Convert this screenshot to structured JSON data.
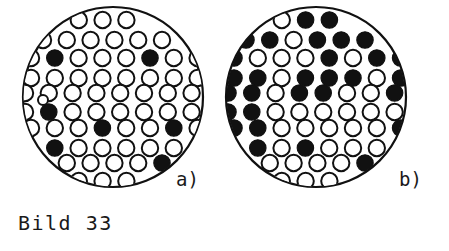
{
  "figure": {
    "caption": "Bild 33",
    "type": "technical-illustration",
    "colors": {
      "background": "#ffffff",
      "stroke": "#111111",
      "filled": "#111111",
      "open_fill": "#ffffff"
    }
  },
  "panels": [
    {
      "id": "a",
      "label": "a)",
      "label_x": 176,
      "label_y": 186,
      "boundary": {
        "cx": 113,
        "cy": 97,
        "r": 90
      },
      "cell_radius": 8.2,
      "row_pitch": 20.6,
      "col_pitch": 23.8,
      "filled_count": 7,
      "open_count": 52,
      "rows": [
        {
          "y": 20,
          "x_start": 55,
          "cells": [
            "open",
            "open",
            "open",
            "open"
          ]
        },
        {
          "y": 40,
          "x_start": 43,
          "cells": [
            "open",
            "open",
            "open",
            "open",
            "open",
            "open"
          ]
        },
        {
          "y": 58,
          "x_start": 31,
          "cells": [
            "open",
            "filled",
            "open",
            "open",
            "open",
            "filled",
            "open",
            "open"
          ]
        },
        {
          "y": 78,
          "x_start": 31,
          "cells": [
            "open",
            "open",
            "open",
            "open",
            "open",
            "open",
            "open",
            "open"
          ]
        },
        {
          "y": 93,
          "x_start": 25,
          "cells": [
            "open",
            "open",
            "open",
            "open",
            "open",
            "open",
            "open",
            "open",
            "open"
          ]
        },
        {
          "y": 112,
          "x_start": 25,
          "cells": [
            "open",
            "filled",
            "open",
            "open",
            "open",
            "open",
            "open",
            "open",
            "open"
          ]
        },
        {
          "y": 128,
          "x_start": 31,
          "cells": [
            "open",
            "open",
            "open",
            "filled",
            "open",
            "open",
            "filled",
            "open"
          ]
        },
        {
          "y": 148,
          "x_start": 31,
          "cells": [
            "open",
            "filled",
            "open",
            "open",
            "open",
            "open",
            "open",
            "open"
          ]
        },
        {
          "y": 163,
          "x_start": 43,
          "cells": [
            "open",
            "open",
            "open",
            "open",
            "open",
            "filled"
          ]
        },
        {
          "y": 181,
          "x_start": 55,
          "cells": [
            "open",
            "open",
            "open",
            "open"
          ]
        }
      ],
      "extra_cells": [
        {
          "x": 43,
          "y": 100,
          "r": 5.0,
          "state": "open"
        }
      ]
    },
    {
      "id": "b",
      "label": "b)",
      "label_x": 399,
      "label_y": 186,
      "boundary": {
        "cx": 316,
        "cy": 97,
        "r": 90
      },
      "cell_radius": 8.2,
      "row_pitch": 20.6,
      "col_pitch": 23.8,
      "filled_count": 34,
      "open_count": 32,
      "rows": [
        {
          "y": 20,
          "x_start": 258,
          "cells": [
            "filled",
            "open",
            "filled",
            "filled"
          ]
        },
        {
          "y": 40,
          "x_start": 246,
          "cells": [
            "filled",
            "filled",
            "open",
            "filled",
            "filled",
            "filled"
          ]
        },
        {
          "y": 58,
          "x_start": 234,
          "cells": [
            "filled",
            "open",
            "open",
            "open",
            "filled",
            "open",
            "filled",
            "filled"
          ]
        },
        {
          "y": 78,
          "x_start": 234,
          "cells": [
            "filled",
            "filled",
            "open",
            "filled",
            "filled",
            "filled",
            "open",
            "filled"
          ]
        },
        {
          "y": 93,
          "x_start": 228,
          "cells": [
            "filled",
            "filled",
            "open",
            "filled",
            "filled",
            "open",
            "open",
            "filled",
            "open"
          ]
        },
        {
          "y": 112,
          "x_start": 228,
          "cells": [
            "filled",
            "filled",
            "open",
            "open",
            "open",
            "open",
            "open",
            "open",
            "filled"
          ]
        },
        {
          "y": 128,
          "x_start": 234,
          "cells": [
            "filled",
            "filled",
            "open",
            "open",
            "open",
            "open",
            "open",
            "filled"
          ]
        },
        {
          "y": 148,
          "x_start": 234,
          "cells": [
            "filled",
            "filled",
            "open",
            "filled",
            "open",
            "open",
            "open",
            "open"
          ]
        },
        {
          "y": 163,
          "x_start": 246,
          "cells": [
            "filled",
            "open",
            "open",
            "open",
            "open",
            "filled"
          ]
        },
        {
          "y": 181,
          "x_start": 258,
          "cells": [
            "filled",
            "open",
            "open",
            "open"
          ]
        }
      ],
      "extra_cells": []
    }
  ],
  "caption_position": {
    "x": 18,
    "y": 230
  }
}
